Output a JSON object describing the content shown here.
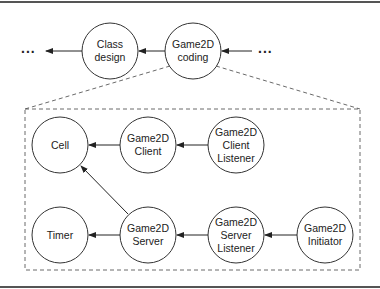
{
  "diagram": {
    "top_row": {
      "left_ellipsis": "...",
      "right_ellipsis": "...",
      "nodes": [
        {
          "id": "class-design",
          "label": "Class\ndesign",
          "lines": [
            "Class",
            "design"
          ]
        },
        {
          "id": "game2d-coding",
          "label": "Game2D\ncoding",
          "lines": [
            "Game2D",
            "coding"
          ]
        }
      ]
    },
    "expanded": {
      "nodes": [
        {
          "id": "cell",
          "lines": [
            "Cell"
          ]
        },
        {
          "id": "game2d-client",
          "lines": [
            "Game2D",
            "Client"
          ]
        },
        {
          "id": "game2d-client-listener",
          "lines": [
            "Game2D",
            "Client",
            "Listener"
          ]
        },
        {
          "id": "timer",
          "lines": [
            "Timer"
          ]
        },
        {
          "id": "game2d-server",
          "lines": [
            "Game2D",
            "Server"
          ]
        },
        {
          "id": "game2d-server-listener",
          "lines": [
            "Game2D",
            "Server",
            "Listener"
          ]
        },
        {
          "id": "game2d-initiator",
          "lines": [
            "Game2D",
            "Initiator"
          ]
        }
      ],
      "edges": [
        {
          "from": "game2d-client",
          "to": "cell"
        },
        {
          "from": "game2d-client-listener",
          "to": "game2d-client"
        },
        {
          "from": "game2d-server",
          "to": "cell"
        },
        {
          "from": "game2d-server",
          "to": "timer"
        },
        {
          "from": "game2d-server-listener",
          "to": "game2d-server"
        },
        {
          "from": "game2d-initiator",
          "to": "game2d-server-listener"
        }
      ]
    },
    "top_edges": [
      {
        "from": "class-design",
        "to": "left-ellipsis"
      },
      {
        "from": "game2d-coding",
        "to": "class-design"
      },
      {
        "from": "right-ellipsis",
        "to": "game2d-coding"
      }
    ]
  }
}
